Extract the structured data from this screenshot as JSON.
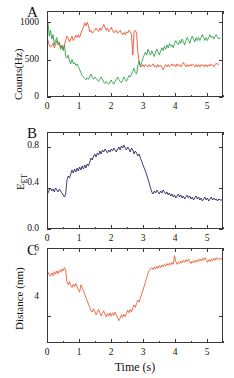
{
  "figure": {
    "panels": [
      "A",
      "B",
      "C"
    ],
    "shared_xlabel": "Time (s)",
    "xlim": [
      0,
      5.5
    ],
    "xticks": [
      0,
      1,
      2,
      3,
      4,
      5
    ],
    "xtick_labels": [
      "0",
      "1",
      "2",
      "3",
      "4",
      "5"
    ],
    "xminor_step": 0.5
  },
  "colors": {
    "donor_red": "#E8502A",
    "acceptor_green": "#2E9E48",
    "efret_navy": "#262663",
    "distance_orange": "#EE5C33",
    "axis": "#3a3a3a",
    "background": "#ffffff"
  },
  "panelA": {
    "letter": "A",
    "ylabel": "Counts(Hz)",
    "ylim": [
      0,
      1150
    ],
    "yticks": [
      0,
      500,
      1000
    ],
    "ytick_labels": [
      "0",
      "500",
      "1000"
    ],
    "series_names": [
      "donor",
      "acceptor"
    ]
  },
  "panelB": {
    "letter": "B",
    "ylabel_main": "E",
    "ylabel_sub": "ET",
    "ylim": [
      0.0,
      0.95
    ],
    "yticks": [
      0.0,
      0.4,
      0.8
    ],
    "ytick_labels": [
      "0.0",
      "0.4",
      "0.8"
    ],
    "series_names": [
      "efret"
    ]
  },
  "panelC": {
    "letter": "C",
    "ylabel": "Distance (nm)",
    "ylim": [
      3.2,
      6.0
    ],
    "yticks": [
      4,
      6
    ],
    "ytick_labels": [
      "4",
      "6"
    ],
    "series_names": [
      "distance"
    ]
  },
  "chart_data": [
    {
      "type": "line",
      "title": "A",
      "xlabel": "Time (s)",
      "ylabel": "Counts(Hz)",
      "xlim": [
        0,
        5.5
      ],
      "ylim": [
        0,
        1150
      ],
      "xticks": [
        0,
        1,
        2,
        3,
        4,
        5
      ],
      "yticks": [
        0,
        500,
        1000
      ],
      "grid": false,
      "legend": "none",
      "x": [
        0.0,
        0.04,
        0.08,
        0.12,
        0.16,
        0.2,
        0.24,
        0.28,
        0.32,
        0.36,
        0.4,
        0.44,
        0.48,
        0.52,
        0.56,
        0.6,
        0.64,
        0.68,
        0.72,
        0.76,
        0.8,
        0.84,
        0.88,
        0.92,
        0.96,
        1.0,
        1.04,
        1.08,
        1.12,
        1.16,
        1.2,
        1.24,
        1.28,
        1.32,
        1.36,
        1.4,
        1.44,
        1.48,
        1.52,
        1.56,
        1.6,
        1.64,
        1.68,
        1.72,
        1.76,
        1.8,
        1.84,
        1.88,
        1.92,
        1.96,
        2.0,
        2.04,
        2.08,
        2.12,
        2.16,
        2.2,
        2.24,
        2.28,
        2.32,
        2.36,
        2.4,
        2.44,
        2.48,
        2.52,
        2.56,
        2.6,
        2.64,
        2.68,
        2.72,
        2.76,
        2.8,
        2.84,
        2.88,
        2.92,
        2.96,
        3.0,
        3.04,
        3.08,
        3.12,
        3.16,
        3.2,
        3.24,
        3.28,
        3.32,
        3.36,
        3.4,
        3.44,
        3.48,
        3.52,
        3.56,
        3.6,
        3.64,
        3.68,
        3.72,
        3.76,
        3.8,
        3.84,
        3.88,
        3.92,
        3.96,
        4.0,
        4.04,
        4.08,
        4.12,
        4.16,
        4.2,
        4.24,
        4.28,
        4.32,
        4.36,
        4.4,
        4.44,
        4.48,
        4.52,
        4.56,
        4.6,
        4.64,
        4.68,
        4.72,
        4.76,
        4.8,
        4.84,
        4.88,
        4.92,
        4.96,
        5.0,
        5.04,
        5.08,
        5.12,
        5.16,
        5.2,
        5.24,
        5.28,
        5.32,
        5.36,
        5.4,
        5.44,
        5.5
      ],
      "series": [
        {
          "name": "donor",
          "color": "#E8502A",
          "values": [
            760,
            700,
            670,
            690,
            720,
            660,
            700,
            760,
            730,
            700,
            660,
            700,
            640,
            700,
            770,
            820,
            790,
            740,
            780,
            820,
            760,
            790,
            830,
            800,
            840,
            800,
            860,
            900,
            940,
            1000,
            960,
            1010,
            960,
            880,
            900,
            860,
            880,
            900,
            930,
            900,
            880,
            930,
            900,
            940,
            980,
            940,
            900,
            930,
            880,
            900,
            940,
            900,
            870,
            880,
            900,
            860,
            880,
            900,
            860,
            840,
            870,
            840,
            880,
            860,
            900,
            880,
            840,
            560,
            880,
            900,
            860,
            600,
            470,
            420,
            400,
            430,
            400,
            430,
            410,
            400,
            430,
            400,
            420,
            440,
            400,
            420,
            390,
            430,
            400,
            420,
            390,
            360,
            400,
            430,
            400,
            430,
            400,
            420,
            440,
            410,
            430,
            400,
            440,
            410,
            430,
            400,
            430,
            460,
            430,
            400,
            430,
            400,
            430,
            410,
            440,
            420,
            400,
            430,
            400,
            430,
            400,
            430,
            410,
            430,
            400,
            430,
            400,
            430,
            410,
            440,
            420,
            400,
            430,
            450,
            430,
            440
          ]
        },
        {
          "name": "acceptor",
          "color": "#2E9E48",
          "values": [
            1000,
            820,
            900,
            780,
            840,
            700,
            760,
            800,
            700,
            740,
            640,
            680,
            620,
            700,
            540,
            520,
            560,
            480,
            440,
            500,
            440,
            460,
            420,
            440,
            400,
            360,
            320,
            280,
            260,
            240,
            220,
            250,
            230,
            270,
            300,
            250,
            230,
            260,
            240,
            220,
            200,
            230,
            260,
            230,
            190,
            170,
            200,
            180,
            160,
            190,
            220,
            180,
            160,
            200,
            230,
            260,
            220,
            200,
            180,
            220,
            260,
            230,
            200,
            240,
            280,
            260,
            300,
            340,
            380,
            320,
            300,
            420,
            480,
            400,
            460,
            520,
            560,
            600,
            560,
            640,
            600,
            560,
            620,
            580,
            540,
            600,
            640,
            600,
            560,
            620,
            660,
            620,
            680,
            640,
            700,
            660,
            720,
            680,
            700,
            660,
            720,
            760,
            720,
            700,
            760,
            720,
            780,
            740,
            700,
            760,
            800,
            760,
            720,
            780,
            820,
            780,
            740,
            800,
            760,
            800,
            760,
            800,
            840,
            800,
            760,
            800,
            760,
            800,
            840,
            800,
            820,
            780,
            820,
            840,
            800,
            780,
            800
          ]
        }
      ]
    },
    {
      "type": "line",
      "title": "B",
      "xlabel": "Time (s)",
      "ylabel": "E_ET",
      "xlim": [
        0,
        5.5
      ],
      "ylim": [
        0.0,
        0.95
      ],
      "xticks": [
        0,
        1,
        2,
        3,
        4,
        5
      ],
      "yticks": [
        0.0,
        0.4,
        0.8
      ],
      "grid": false,
      "legend": "none",
      "x": [
        0.0,
        0.04,
        0.08,
        0.12,
        0.16,
        0.2,
        0.24,
        0.28,
        0.32,
        0.36,
        0.4,
        0.44,
        0.48,
        0.52,
        0.56,
        0.6,
        0.64,
        0.68,
        0.72,
        0.76,
        0.8,
        0.84,
        0.88,
        0.92,
        0.96,
        1.0,
        1.04,
        1.08,
        1.12,
        1.16,
        1.2,
        1.24,
        1.28,
        1.32,
        1.36,
        1.4,
        1.44,
        1.48,
        1.52,
        1.56,
        1.6,
        1.64,
        1.68,
        1.72,
        1.76,
        1.8,
        1.84,
        1.88,
        1.92,
        1.96,
        2.0,
        2.04,
        2.08,
        2.12,
        2.16,
        2.2,
        2.24,
        2.28,
        2.32,
        2.36,
        2.4,
        2.44,
        2.48,
        2.52,
        2.56,
        2.6,
        2.64,
        2.68,
        2.72,
        2.76,
        2.8,
        2.84,
        2.88,
        2.92,
        2.96,
        3.0,
        3.04,
        3.08,
        3.12,
        3.16,
        3.2,
        3.24,
        3.28,
        3.32,
        3.36,
        3.4,
        3.44,
        3.48,
        3.52,
        3.56,
        3.6,
        3.64,
        3.68,
        3.72,
        3.76,
        3.8,
        3.84,
        3.88,
        3.92,
        3.96,
        4.0,
        4.04,
        4.08,
        4.12,
        4.16,
        4.2,
        4.24,
        4.28,
        4.32,
        4.36,
        4.4,
        4.44,
        4.48,
        4.52,
        4.56,
        4.6,
        4.64,
        4.68,
        4.72,
        4.76,
        4.8,
        4.84,
        4.88,
        4.92,
        4.96,
        5.0,
        5.04,
        5.08,
        5.12,
        5.16,
        5.2,
        5.24,
        5.28,
        5.32,
        5.36,
        5.4,
        5.44,
        5.5
      ],
      "series": [
        {
          "name": "efret",
          "color": "#262663",
          "values": [
            0.35,
            0.38,
            0.4,
            0.37,
            0.39,
            0.36,
            0.4,
            0.38,
            0.36,
            0.39,
            0.37,
            0.35,
            0.33,
            0.31,
            0.34,
            0.48,
            0.52,
            0.5,
            0.54,
            0.58,
            0.55,
            0.59,
            0.56,
            0.6,
            0.57,
            0.61,
            0.58,
            0.62,
            0.59,
            0.63,
            0.6,
            0.64,
            0.62,
            0.66,
            0.7,
            0.68,
            0.72,
            0.74,
            0.71,
            0.75,
            0.73,
            0.77,
            0.74,
            0.78,
            0.76,
            0.79,
            0.77,
            0.75,
            0.78,
            0.76,
            0.79,
            0.77,
            0.8,
            0.78,
            0.76,
            0.79,
            0.81,
            0.78,
            0.82,
            0.8,
            0.83,
            0.8,
            0.78,
            0.81,
            0.79,
            0.76,
            0.8,
            0.78,
            0.74,
            0.77,
            0.75,
            0.72,
            0.74,
            0.7,
            0.67,
            0.63,
            0.6,
            0.57,
            0.53,
            0.49,
            0.45,
            0.4,
            0.36,
            0.34,
            0.37,
            0.35,
            0.38,
            0.36,
            0.34,
            0.37,
            0.35,
            0.38,
            0.36,
            0.34,
            0.36,
            0.33,
            0.35,
            0.32,
            0.34,
            0.31,
            0.33,
            0.3,
            0.32,
            0.34,
            0.31,
            0.33,
            0.3,
            0.32,
            0.29,
            0.31,
            0.33,
            0.3,
            0.32,
            0.29,
            0.31,
            0.28,
            0.3,
            0.32,
            0.29,
            0.31,
            0.28,
            0.3,
            0.27,
            0.29,
            0.31,
            0.28,
            0.3,
            0.27,
            0.29,
            0.31,
            0.28,
            0.3,
            0.28,
            0.29,
            0.27,
            0.29,
            0.28,
            0.28
          ]
        }
      ]
    },
    {
      "type": "line",
      "title": "C",
      "xlabel": "Time (s)",
      "ylabel": "Distance (nm)",
      "xlim": [
        0,
        5.5
      ],
      "ylim": [
        3.2,
        6.0
      ],
      "xticks": [
        0,
        1,
        2,
        3,
        4,
        5
      ],
      "yticks": [
        4,
        6
      ],
      "grid": false,
      "legend": "none",
      "x": [
        0.0,
        0.04,
        0.08,
        0.12,
        0.16,
        0.2,
        0.24,
        0.28,
        0.32,
        0.36,
        0.4,
        0.44,
        0.48,
        0.52,
        0.56,
        0.6,
        0.64,
        0.68,
        0.72,
        0.76,
        0.8,
        0.84,
        0.88,
        0.92,
        0.96,
        1.0,
        1.04,
        1.08,
        1.12,
        1.16,
        1.2,
        1.24,
        1.28,
        1.32,
        1.36,
        1.4,
        1.44,
        1.48,
        1.52,
        1.56,
        1.6,
        1.64,
        1.68,
        1.72,
        1.76,
        1.8,
        1.84,
        1.88,
        1.92,
        1.96,
        2.0,
        2.04,
        2.08,
        2.12,
        2.16,
        2.2,
        2.24,
        2.28,
        2.32,
        2.36,
        2.4,
        2.44,
        2.48,
        2.52,
        2.56,
        2.6,
        2.64,
        2.68,
        2.72,
        2.76,
        2.8,
        2.84,
        2.88,
        2.92,
        2.96,
        3.0,
        3.04,
        3.08,
        3.12,
        3.16,
        3.2,
        3.24,
        3.28,
        3.32,
        3.36,
        3.4,
        3.44,
        3.48,
        3.52,
        3.56,
        3.6,
        3.64,
        3.68,
        3.72,
        3.76,
        3.8,
        3.84,
        3.88,
        3.92,
        3.96,
        4.0,
        4.04,
        4.08,
        4.12,
        4.16,
        4.2,
        4.24,
        4.28,
        4.32,
        4.36,
        4.4,
        4.44,
        4.48,
        4.52,
        4.56,
        4.6,
        4.64,
        4.68,
        4.72,
        4.76,
        4.8,
        4.84,
        4.88,
        4.92,
        4.96,
        5.0,
        5.04,
        5.08,
        5.12,
        5.16,
        5.2,
        5.24,
        5.28,
        5.32,
        5.36,
        5.4,
        5.44,
        5.5
      ],
      "series": [
        {
          "name": "distance",
          "color": "#EE5C33",
          "values": [
            5.3,
            5.22,
            5.18,
            5.28,
            5.2,
            5.32,
            5.24,
            5.34,
            5.26,
            5.36,
            5.3,
            5.4,
            5.34,
            5.44,
            5.36,
            5.0,
            4.92,
            5.02,
            4.9,
            4.84,
            4.94,
            4.86,
            4.96,
            4.88,
            4.78,
            4.7,
            4.92,
            4.84,
            4.74,
            4.64,
            4.54,
            4.44,
            4.34,
            4.24,
            4.14,
            4.1,
            4.2,
            4.12,
            4.02,
            4.1,
            4.18,
            4.08,
            3.98,
            4.06,
            4.14,
            4.04,
            3.96,
            4.06,
            3.98,
            4.08,
            3.98,
            4.08,
            4.0,
            4.1,
            4.02,
            3.92,
            3.84,
            3.92,
            4.02,
            3.94,
            4.04,
            3.96,
            4.06,
            4.16,
            4.08,
            4.18,
            4.1,
            4.22,
            4.32,
            4.24,
            4.36,
            4.46,
            4.4,
            4.52,
            4.64,
            4.76,
            4.88,
            5.0,
            5.14,
            5.26,
            5.36,
            5.4,
            5.44,
            5.38,
            5.46,
            5.4,
            5.48,
            5.42,
            5.5,
            5.44,
            5.52,
            5.46,
            5.54,
            5.48,
            5.56,
            5.5,
            5.58,
            5.52,
            5.6,
            5.54,
            5.8,
            5.62,
            5.54,
            5.62,
            5.56,
            5.64,
            5.58,
            5.66,
            5.6,
            5.68,
            5.62,
            5.7,
            5.64,
            5.56,
            5.64,
            5.58,
            5.66,
            5.6,
            5.68,
            5.62,
            5.7,
            5.64,
            5.72,
            5.66,
            5.74,
            5.68,
            5.6,
            5.68,
            5.62,
            5.7,
            5.64,
            5.72,
            5.66,
            5.74,
            5.68,
            5.72,
            5.7,
            5.7
          ]
        }
      ]
    }
  ]
}
